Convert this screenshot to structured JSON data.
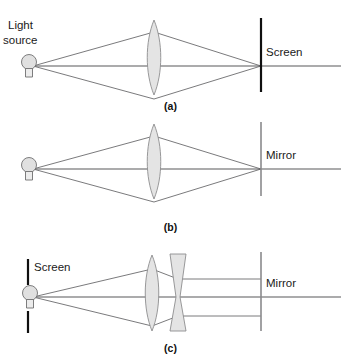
{
  "figure": {
    "background": "#ffffff",
    "ray_color": "#58585a",
    "lens_fill": "#e4e4e4",
    "lens_stroke": "#8d8d8f",
    "screen_color": "#101010",
    "mirror_color": "#8a8a8c"
  },
  "panels": [
    {
      "id": "a",
      "caption": "(a)",
      "labels": {
        "light_source": "Light\nsource",
        "light_source_line1": "Light",
        "light_source_line2": "source",
        "target": "Screen"
      },
      "elements": {
        "source": "light-bulb",
        "lens": "convex-lens",
        "target_type": "screen",
        "ray_pattern": "diverging-then-converging-to-point"
      }
    },
    {
      "id": "b",
      "caption": "(b)",
      "labels": {
        "target": "Mirror"
      },
      "elements": {
        "source": "light-bulb",
        "lens": "convex-lens",
        "target_type": "mirror",
        "ray_pattern": "diverging-then-converging-to-point"
      }
    },
    {
      "id": "c",
      "caption": "(c)",
      "labels": {
        "screen": "Screen",
        "target": "Mirror"
      },
      "elements": {
        "source": "light-bulb",
        "lens_1": "convex-lens",
        "lens_2": "concave-lens",
        "screen_type": "split-screen-with-gap",
        "target_type": "mirror",
        "ray_pattern": "diverging-converging-then-collimated"
      }
    }
  ]
}
